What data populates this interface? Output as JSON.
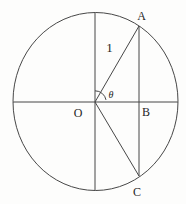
{
  "figure": {
    "background": "#fdfdfc",
    "line_color": "#474747",
    "text_color": "#1f1f1f",
    "labels": {
      "point_a": "A",
      "point_b": "B",
      "point_c": "C",
      "center": "O",
      "radius_length": "1",
      "angle": "θ"
    },
    "diagram": {
      "width": 186,
      "height": 204,
      "circle": {
        "cx": 95.5,
        "cy": 101.5,
        "rx": 82.5,
        "ry": 89
      },
      "lines": [
        {
          "name": "horizontal-diameter",
          "x1": 13,
          "y1": 102,
          "x2": 178,
          "y2": 102
        },
        {
          "name": "vertical-diameter",
          "x1": 95,
          "y1": 12.5,
          "x2": 95,
          "y2": 190.5
        },
        {
          "name": "radius-oa",
          "x1": 95,
          "y1": 102,
          "x2": 139,
          "y2": 26
        },
        {
          "name": "segment-oc",
          "x1": 95,
          "y1": 102,
          "x2": 139,
          "y2": 176
        },
        {
          "name": "chord-ac",
          "x1": 139,
          "y1": 26,
          "x2": 139,
          "y2": 176
        }
      ],
      "angle_arc": {
        "name": "angle-theta-arc",
        "d": "M 95 90.8 A 11.2 11.2 0 0 1 106 99.9"
      },
      "texts": [
        {
          "name": "label-point-a",
          "key": "point_a",
          "x": 141.5,
          "y": 19.5,
          "size": 12,
          "italic": false
        },
        {
          "name": "label-radius-length",
          "key": "radius_length",
          "x": 109.5,
          "y": 52,
          "size": 13,
          "italic": false
        },
        {
          "name": "label-angle-theta",
          "key": "angle",
          "x": 111,
          "y": 97.5,
          "size": 10,
          "italic": true
        },
        {
          "name": "label-center-o",
          "key": "center",
          "x": 78,
          "y": 116.5,
          "size": 12,
          "italic": false
        },
        {
          "name": "label-point-b",
          "key": "point_b",
          "x": 146,
          "y": 116,
          "size": 12,
          "italic": false
        },
        {
          "name": "label-point-c",
          "key": "point_c",
          "x": 137,
          "y": 195.5,
          "size": 12,
          "italic": false
        }
      ]
    }
  }
}
